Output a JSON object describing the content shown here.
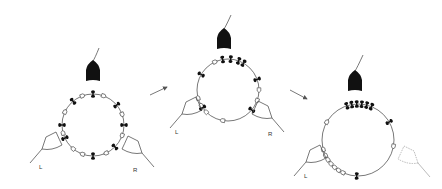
{
  "figure": {
    "colors": {
      "ink": "#111111",
      "line": "#555555",
      "faded": "#aaaaaa",
      "background": "#ffffff"
    },
    "panels": [
      {
        "id": 1,
        "labels": {
          "left": "L",
          "right": "R"
        },
        "ring": {
          "cx": 93,
          "cy": 125,
          "r": 31
        },
        "tip": {
          "x": 93,
          "y": 72
        },
        "black_marker_angles": [
          -90,
          -130,
          -40,
          180,
          155,
          0,
          45,
          90
        ],
        "open_marker_angles": [
          -110,
          -70,
          -155,
          -20,
          20,
          130,
          110,
          65,
          165
        ],
        "left_cell": "solid",
        "right_cell": "solid"
      },
      {
        "id": 2,
        "labels": {
          "left": "L",
          "right": "R"
        },
        "ring": {
          "cx": 228,
          "cy": 90,
          "r": 31
        },
        "tip": {
          "x": 224,
          "y": 40
        },
        "black_marker_angles": [
          -100,
          -85,
          -70,
          -60,
          -150,
          -20,
          145,
          40
        ],
        "open_marker_angles": [
          -115,
          0,
          165,
          150,
          135,
          100,
          20
        ],
        "left_cell": "solid",
        "right_cell": "solid"
      },
      {
        "id": 3,
        "labels": {
          "left": "L"
        },
        "ring": {
          "cx": 358,
          "cy": 140,
          "r": 36
        },
        "tip": {
          "x": 355,
          "y": 82
        },
        "black_marker_angles": [
          -108,
          -100,
          -92,
          -84,
          -76,
          -68,
          -30,
          92
        ],
        "open_marker_angles": [
          -150,
          10,
          155,
          147,
          139,
          131,
          123,
          115,
          165
        ],
        "left_cell": "solid",
        "right_cell": "faded"
      }
    ],
    "arrows": [
      {
        "from": [
          150,
          95
        ],
        "to": [
          167,
          87
        ]
      },
      {
        "from": [
          290,
          90
        ],
        "to": [
          307,
          99
        ]
      }
    ]
  }
}
